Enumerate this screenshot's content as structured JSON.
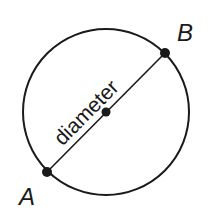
{
  "diagram": {
    "type": "circle-diameter",
    "circle": {
      "cx": 106,
      "cy": 112,
      "r": 83,
      "stroke": "#1a1a1a"
    },
    "center_point": {
      "x": 106,
      "y": 112
    },
    "points": [
      {
        "id": "A",
        "label": "A",
        "x": 47,
        "y": 172,
        "label_x": 19,
        "label_y": 205
      },
      {
        "id": "B",
        "label": "B",
        "x": 165,
        "y": 53,
        "label_x": 177,
        "label_y": 41
      }
    ],
    "segment": {
      "from": "A",
      "to": "B",
      "label": "diameter"
    },
    "colors": {
      "ink": "#1a1a1a",
      "background": "#ffffff"
    }
  }
}
